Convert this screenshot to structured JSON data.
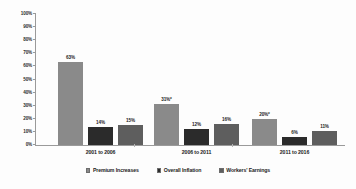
{
  "chart_data": {
    "type": "bar",
    "title": "",
    "subtitle": "",
    "xlabel": "",
    "ylabel": "",
    "ylim": [
      0,
      100
    ],
    "grid": false,
    "legend_position": "bottom",
    "categories": [
      "2001 to 2006",
      "2006 to 2011",
      "2011 to 2016"
    ],
    "y_ticks": [
      "0%",
      "10%",
      "20%",
      "30%",
      "40%",
      "50%",
      "60%",
      "70%",
      "80%",
      "90%",
      "100%"
    ],
    "y_tick_values": [
      0,
      10,
      20,
      30,
      40,
      50,
      60,
      70,
      80,
      90,
      100
    ],
    "series": [
      {
        "name": "Premium Increases",
        "color": "#8a8a8a",
        "values": [
          63,
          31,
          20
        ],
        "data_labels": [
          "63%",
          "31%*",
          "20%*"
        ]
      },
      {
        "name": "Overall Inflation",
        "color": "#2b2b2b",
        "values": [
          14,
          12,
          6
        ],
        "data_labels": [
          "14%",
          "12%",
          "6%"
        ]
      },
      {
        "name": "Workers' Earnings",
        "color": "#5e5e5e",
        "values": [
          15,
          16,
          11
        ],
        "data_labels": [
          "15%",
          "16%",
          "11%"
        ]
      }
    ]
  },
  "legend": {
    "items": [
      {
        "label": "Premium Increases",
        "color": "#8a8a8a"
      },
      {
        "label": "Overall Inflation",
        "color": "#2b2b2b"
      },
      {
        "label": "Workers' Earnings",
        "color": "#5e5e5e"
      }
    ]
  },
  "axis": {
    "y_labels": [
      "100%",
      "90%",
      "80%",
      "70%",
      "60%",
      "50%",
      "40%",
      "30%",
      "20%",
      "10%",
      "0%"
    ]
  }
}
